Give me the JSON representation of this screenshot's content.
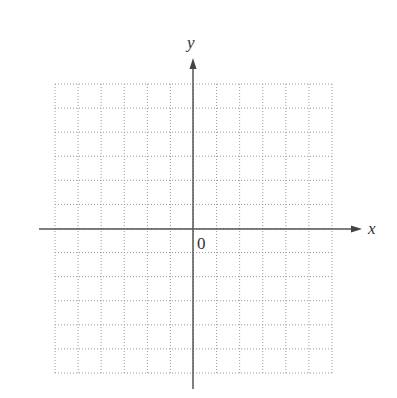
{
  "diagram": {
    "type": "coordinate-grid",
    "x_axis_label": "x",
    "y_axis_label": "y",
    "origin_label": "0",
    "grid": {
      "columns": 12,
      "rows": 12,
      "left": 55,
      "right": 332,
      "top": 84,
      "bottom": 373,
      "line_style": "dotted",
      "line_color": "#9a9a9a"
    },
    "axes": {
      "origin_x": 193,
      "origin_y": 229,
      "x_start": 39,
      "x_end": 362,
      "y_start": 389,
      "y_end": 58,
      "color": "#555555"
    }
  }
}
